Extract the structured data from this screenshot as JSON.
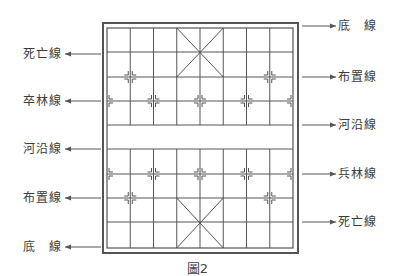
{
  "figure": {
    "caption": "圖2",
    "board": {
      "outer_border": {
        "x": 103,
        "y": 23,
        "w": 195,
        "h": 230
      },
      "grid": {
        "x0": 107,
        "y0": 28,
        "x1": 293,
        "y1": 248,
        "cols": 9,
        "rows": 10
      },
      "row_y": [
        28,
        52,
        77,
        101,
        125,
        149,
        174,
        198,
        222,
        248
      ],
      "river_rows": [
        4,
        5
      ],
      "palaces": [
        {
          "col_from": 3,
          "col_to": 5,
          "row_from": 0,
          "row_to": 2
        },
        {
          "col_from": 3,
          "col_to": 5,
          "row_from": 7,
          "row_to": 9
        }
      ],
      "markers": [
        {
          "col": 1,
          "row": 2
        },
        {
          "col": 7,
          "row": 2
        },
        {
          "col": 0,
          "row": 3
        },
        {
          "col": 2,
          "row": 3
        },
        {
          "col": 4,
          "row": 3
        },
        {
          "col": 6,
          "row": 3
        },
        {
          "col": 8,
          "row": 3
        },
        {
          "col": 0,
          "row": 6
        },
        {
          "col": 2,
          "row": 6
        },
        {
          "col": 4,
          "row": 6
        },
        {
          "col": 6,
          "row": 6
        },
        {
          "col": 8,
          "row": 6
        },
        {
          "col": 1,
          "row": 7
        },
        {
          "col": 7,
          "row": 7
        }
      ],
      "line_color": "#555555",
      "border_color": "#555555"
    },
    "left_labels": [
      {
        "text": "死亡線",
        "y": 54
      },
      {
        "text": "卒林線",
        "y": 101
      },
      {
        "text": "河沿線",
        "y": 149
      },
      {
        "text": "布置線",
        "y": 198
      },
      {
        "text": "底　線",
        "y": 247
      }
    ],
    "right_labels": [
      {
        "text": "底　線",
        "y": 26
      },
      {
        "text": "布置線",
        "y": 77
      },
      {
        "text": "河沿線",
        "y": 125
      },
      {
        "text": "兵林線",
        "y": 174
      },
      {
        "text": "死亡線",
        "y": 222
      }
    ]
  }
}
